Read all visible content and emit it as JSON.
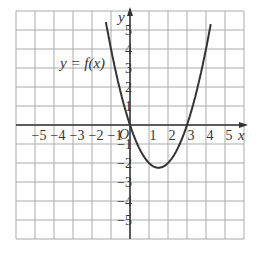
{
  "chart_data": {
    "type": "line",
    "title": "",
    "curve_label": "y = f(x)",
    "xlabel": "x",
    "ylabel": "y",
    "origin_label": "O",
    "xlim": [
      -6,
      6
    ],
    "ylim": [
      -6,
      6
    ],
    "grid": true,
    "x_ticks": [
      "-5",
      "-4",
      "-3",
      "-2",
      "-1",
      "1",
      "2",
      "3",
      "4",
      "5"
    ],
    "y_ticks": [
      "5",
      "4",
      "3",
      "2",
      "1",
      "-1",
      "-2",
      "-3",
      "-4",
      "-5"
    ],
    "series": [
      {
        "name": "y = f(x)",
        "function": "x^2 - 3x",
        "x": [
          -1.2,
          -1,
          -0.5,
          0,
          0.5,
          1,
          1.5,
          2,
          2.5,
          3,
          3.5,
          4,
          4.2
        ],
        "y": [
          5.04,
          4,
          1.75,
          0,
          -1.25,
          -2,
          -2.25,
          -2,
          -1.25,
          0,
          1.75,
          4,
          5.04
        ]
      }
    ],
    "roots": [
      0,
      3
    ],
    "vertex": [
      1.5,
      -2.25
    ]
  }
}
